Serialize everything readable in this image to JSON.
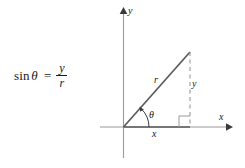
{
  "figure": {
    "kind": "trigonometry-right-triangle-diagram",
    "formula": {
      "function_name": "sin",
      "angle_symbol": "θ",
      "equals": "=",
      "numerator": "y",
      "denominator": "r",
      "full_text": "sin θ = y / r"
    },
    "axes": {
      "y_axis_label": "y",
      "x_axis_label": "x",
      "origin_label": ""
    },
    "triangle": {
      "hypotenuse_label": "r",
      "opposite_label": "y",
      "adjacent_label": "x",
      "angle_label": "θ",
      "right_angle_marker": true
    },
    "colors": {
      "background": "#ffffff",
      "axis": "#9a9a9a",
      "hypotenuse": "#5a5a5a",
      "adjacent": "#5a5a5a",
      "dashed": "#9a9a9a",
      "text": "#1a1a1a"
    }
  }
}
